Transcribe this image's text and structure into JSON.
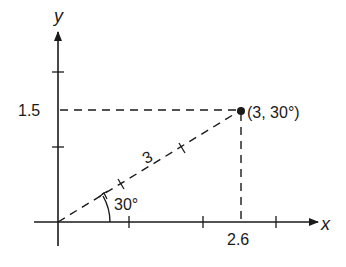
{
  "diagram": {
    "axes": {
      "x_label": "x",
      "y_label": "y"
    },
    "point": {
      "label": "(3, 30°)",
      "polar_r": 3,
      "polar_theta_deg": 30,
      "cartesian_x": 2.6,
      "cartesian_y": 1.5
    },
    "labels": {
      "x_value": "2.6",
      "y_value": "1.5",
      "radius": "3",
      "angle": "30°"
    },
    "colors": {
      "ink": "#1a1a1a",
      "background": "#ffffff"
    }
  }
}
